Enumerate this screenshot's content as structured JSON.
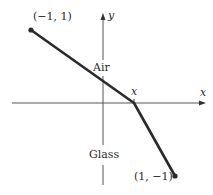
{
  "diagram": {
    "title": "",
    "axes": {
      "x_label": "x",
      "y_label": "y"
    },
    "regions": {
      "upper": "Air",
      "lower": "Glass"
    },
    "points": {
      "start": {
        "label": "(−1, 1)",
        "x": -1,
        "y": 1
      },
      "interface": {
        "label": "x"
      },
      "end": {
        "label": "(1, −1)",
        "x": 1,
        "y": -1
      }
    },
    "colors": {
      "line": "#2a2a2a",
      "axis": "#555555",
      "text": "#2a2a2a"
    }
  }
}
